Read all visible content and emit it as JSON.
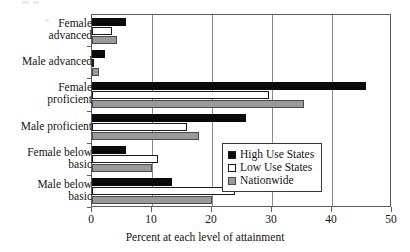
{
  "chart_data": {
    "type": "bar",
    "orientation": "horizontal",
    "title": "",
    "xlabel": "Percent at each level of attainment",
    "ylabel": "",
    "xlim": [
      0,
      50
    ],
    "xticks": [
      0,
      10,
      20,
      30,
      40,
      50
    ],
    "xtick_labels": [
      "0",
      "10",
      "20",
      "30",
      "40",
      "50"
    ],
    "grid": true,
    "legend_position": "center-right",
    "categories": [
      "Female advanced",
      "Male advanced",
      "Female proficient",
      "Male proficient",
      "Female below basic",
      "Male below basic"
    ],
    "category_lines": [
      [
        "Female",
        "advanced"
      ],
      [
        "Male advanced",
        ""
      ],
      [
        "Female",
        "proficient"
      ],
      [
        "Male proficient",
        ""
      ],
      [
        "Female below",
        "basic"
      ],
      [
        "Male below",
        "basic"
      ]
    ],
    "series": [
      {
        "name": "High Use States",
        "color": "#0a0a0a",
        "values": [
          5.7,
          2.2,
          45.7,
          25.7,
          5.7,
          13.3
        ]
      },
      {
        "name": "Low Use States",
        "color": "#ffffff",
        "values": [
          3.4,
          0.4,
          29.5,
          15.8,
          11.0,
          23.8
        ]
      },
      {
        "name": "Nationwide",
        "color": "#9a9a9a",
        "values": [
          4.2,
          1.2,
          35.3,
          17.8,
          10.0,
          20.0
        ]
      }
    ]
  },
  "legend": {
    "items": [
      {
        "label": "High Use States",
        "swatch": "black-swatch"
      },
      {
        "label": "Low Use States",
        "swatch": "white-swatch"
      },
      {
        "label": "Nationwide",
        "swatch": "gray-swatch"
      }
    ]
  }
}
